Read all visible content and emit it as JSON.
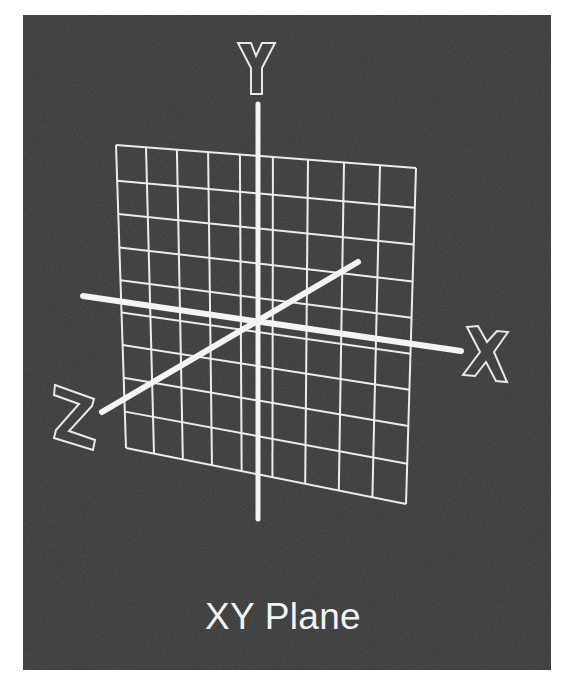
{
  "diagram": {
    "caption": "XY Plane",
    "axes": [
      {
        "name": "X",
        "label": "X"
      },
      {
        "name": "Y",
        "label": "Y"
      },
      {
        "name": "Z",
        "label": "Z"
      }
    ],
    "grid": {
      "columns": 9,
      "rows": 9
    },
    "colors": {
      "background": "#373737",
      "lines": "#f2f2f2",
      "page": "#ffffff"
    }
  }
}
